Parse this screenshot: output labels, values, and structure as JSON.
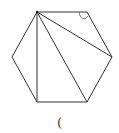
{
  "figure": {
    "shape": "regular-hexagon",
    "vertices": [
      [
        37,
        12
      ],
      [
        87,
        12
      ],
      [
        112,
        57
      ],
      [
        87,
        102
      ],
      [
        37,
        102
      ],
      [
        12,
        57
      ]
    ],
    "diagonals_from_vertex": 0,
    "diagonals": [
      [
        0,
        2
      ],
      [
        0,
        3
      ],
      [
        0,
        4
      ]
    ],
    "marked_angle_vertex": 1,
    "stroke_color": "#333333"
  },
  "caption": {
    "text": "("
  }
}
